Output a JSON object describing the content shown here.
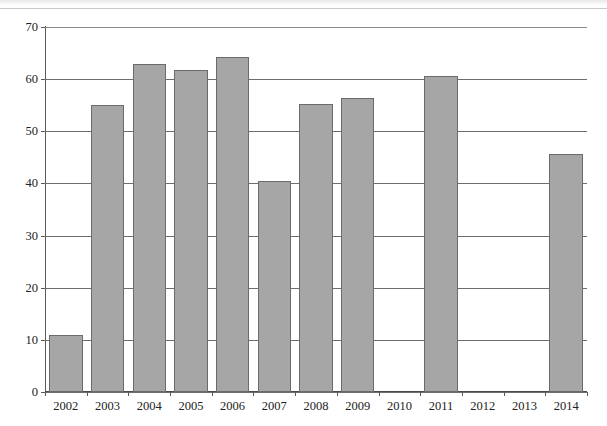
{
  "chart_data": {
    "type": "bar",
    "title": "",
    "subtitle": "",
    "xlabel": "",
    "ylabel": "",
    "categories": [
      "2002",
      "2003",
      "2004",
      "2005",
      "2006",
      "2007",
      "2008",
      "2009",
      "2010",
      "2011",
      "2012",
      "2013",
      "2014"
    ],
    "values": [
      11.0,
      55.1,
      63.0,
      61.7,
      64.2,
      40.4,
      55.3,
      56.4,
      null,
      60.6,
      null,
      null,
      45.6
    ],
    "series": [
      {
        "name": "value",
        "values": [
          11.0,
          55.1,
          63.0,
          61.7,
          64.2,
          40.4,
          55.3,
          56.4,
          null,
          60.6,
          null,
          null,
          45.6
        ]
      }
    ],
    "missing_categories": [
      "2010",
      "2012",
      "2013"
    ],
    "ylim": [
      0,
      70
    ],
    "ytick_labels": [
      "0",
      "10",
      "20",
      "30",
      "40",
      "50",
      "60",
      "70"
    ],
    "ytick_values": [
      0,
      10,
      20,
      30,
      40,
      50,
      60,
      70
    ],
    "grid": "horizontal",
    "legend": "none",
    "bar_color": "#a6a6a6",
    "bar_edge_color": "#6b6b6b",
    "grid_color": "#6e6e6e",
    "axis_color": "#4a4a4a",
    "background_color": "#ffffff"
  }
}
